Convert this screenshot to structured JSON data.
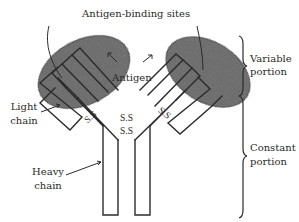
{
  "figure": {
    "title_label": "Antigen-binding sites",
    "antigen_label": "Antigen",
    "light_chain": {
      "line1": "Light",
      "line2": "chain"
    },
    "heavy_chain": {
      "line1": "Heavy",
      "line2": "chain"
    },
    "disulfide_labels": [
      "S.S",
      "S.S",
      "S.S",
      "S.S"
    ],
    "variable_portion": {
      "line1": "Variable",
      "line2": "portion"
    },
    "constant_portion": {
      "line1": "Constant",
      "line2": "portion"
    },
    "colors": {
      "line": "#2b2b2b",
      "oval_fill": "#5a5a5a",
      "oval_light": "#9a9a9a",
      "background": "#ffffff"
    }
  }
}
